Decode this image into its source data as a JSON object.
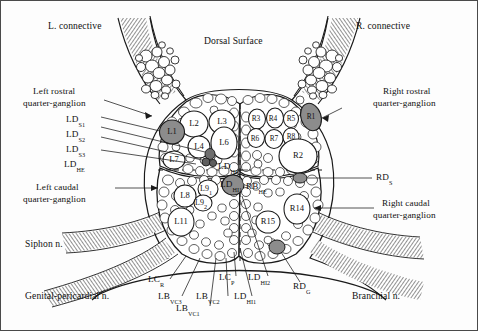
{
  "figure": {
    "title": "Dorsal Surface",
    "colors": {
      "background": "#ffffff",
      "outline": "#1a1a1a",
      "cell_fill": "#fdfdfd",
      "shaded_cell_fill": "#8c8c8c",
      "nerve_hatch": "#6e6e6e",
      "text": "#111111",
      "frame": "#4a4a4a"
    }
  },
  "annotations": {
    "dorsal_surface": "Dorsal Surface",
    "left_connective": "L. connective",
    "right_connective": "R. connective",
    "left_rostral_line1": "Left rostral",
    "left_rostral_line2": "quarter-ganglion",
    "right_rostral_line1": "Right rostral",
    "right_rostral_line2": "quarter-ganglion",
    "left_caudal_line1": "Left caudal",
    "left_caudal_line2": "quarter-ganglion",
    "right_caudal_line1": "Right caudal",
    "right_caudal_line2": "quarter-ganglion",
    "siphon_nerve": "Siphon n.",
    "genital_pericardial_nerve": "Genital-pericardial n.",
    "branchial_nerve": "Branchial n."
  },
  "left_leader_labels": [
    {
      "id": "ld-s1",
      "base": "LD",
      "sub": "S1"
    },
    {
      "id": "ld-s2",
      "base": "LD",
      "sub": "S2"
    },
    {
      "id": "ld-s3",
      "base": "LD",
      "sub": "S3"
    },
    {
      "id": "ld-he",
      "base": "LD",
      "sub": "HE"
    }
  ],
  "right_leader_labels": [
    {
      "id": "rd-s",
      "base": "RD",
      "sub": "S"
    }
  ],
  "bottom_leader_labels": [
    {
      "id": "lc-r",
      "base": "LC",
      "sub": "R"
    },
    {
      "id": "lb-vc3",
      "base": "LB",
      "sub": "VC3"
    },
    {
      "id": "lb-vc1",
      "base": "LB",
      "sub": "VC1"
    },
    {
      "id": "lb-vc2",
      "base": "LB",
      "sub": "VC2"
    },
    {
      "id": "lc-p",
      "base": "LC",
      "sub": "P"
    },
    {
      "id": "ld-hi1",
      "base": "LD",
      "sub": "HI1"
    },
    {
      "id": "ld-hi2",
      "base": "LD",
      "sub": "HI2"
    },
    {
      "id": "rd-g",
      "base": "RD",
      "sub": "G"
    }
  ],
  "interior_labels": [
    {
      "id": "ld-hi2-interior",
      "base": "LD",
      "sub": "HI2"
    },
    {
      "id": "ld-hi1-interior",
      "base": "LD",
      "sub": "HI1"
    },
    {
      "id": "rb-he-interior",
      "base": "RB",
      "sub": "HE"
    }
  ],
  "left_hemiganglion_cells": [
    {
      "id": "L1",
      "label": "L1",
      "shaded": true
    },
    {
      "id": "L2",
      "label": "L2",
      "shaded": false
    },
    {
      "id": "L3",
      "label": "L3",
      "shaded": false
    },
    {
      "id": "L4",
      "label": "L4",
      "shaded": false
    },
    {
      "id": "L6",
      "label": "L6",
      "shaded": false
    },
    {
      "id": "L7",
      "label": "L7",
      "shaded": false
    },
    {
      "id": "L8",
      "label": "L8",
      "shaded": false
    },
    {
      "id": "L9_1",
      "label": "L9",
      "sub": "1",
      "shaded": false
    },
    {
      "id": "L9_2",
      "label": "L9",
      "sub": "2",
      "shaded": false
    },
    {
      "id": "L11",
      "label": "L11",
      "shaded": false
    }
  ],
  "right_hemiganglion_cells": [
    {
      "id": "R1",
      "label": "R1",
      "shaded": true
    },
    {
      "id": "R2",
      "label": "R2",
      "shaded": false
    },
    {
      "id": "R3",
      "label": "R3",
      "shaded": false
    },
    {
      "id": "R4",
      "label": "R4",
      "shaded": false
    },
    {
      "id": "R5",
      "label": "R5",
      "shaded": false
    },
    {
      "id": "R6",
      "label": "R6",
      "shaded": false
    },
    {
      "id": "R7",
      "label": "R7",
      "shaded": false
    },
    {
      "id": "R8",
      "label": "R8",
      "shaded": false
    },
    {
      "id": "R14",
      "label": "R14",
      "shaded": false
    },
    {
      "id": "R15",
      "label": "R15",
      "shaded": false
    }
  ]
}
